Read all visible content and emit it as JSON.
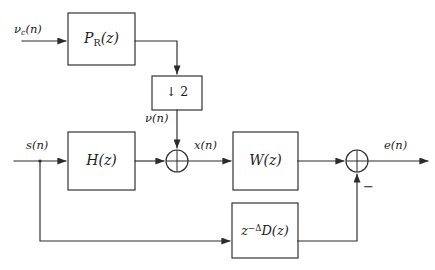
{
  "figure": {
    "type": "signal-flow-block-diagram",
    "background_color": "#ffffff",
    "line_color": "#2b2b2b",
    "width": 435,
    "height": 270
  },
  "blocks": [
    {
      "id": "p_r",
      "label": "P",
      "label_sub": "R",
      "label_tail": "(z)",
      "label_plain": "P_R(z)",
      "x": 68,
      "y": 13,
      "w": 67,
      "h": 52
    },
    {
      "id": "downsampler",
      "label_plain": "↓ 2",
      "x": 152,
      "y": 76,
      "w": 50,
      "h": 34
    },
    {
      "id": "h_z",
      "label_plain": "H(z)",
      "x": 68,
      "y": 132,
      "w": 67,
      "h": 58
    },
    {
      "id": "w_z",
      "label_plain": "W(z)",
      "x": 233,
      "y": 132,
      "w": 65,
      "h": 58
    },
    {
      "id": "d_z",
      "label_plain": "z^{-Δ}D(z)",
      "label_base": "z",
      "label_exp": "−Δ",
      "label_tail": "D(z)",
      "x": 232,
      "y": 203,
      "w": 66,
      "h": 55
    }
  ],
  "sum_nodes": [
    {
      "id": "sum_left",
      "cx": 177,
      "cy": 161,
      "r": 11,
      "style": "cross"
    },
    {
      "id": "sum_right",
      "cx": 357,
      "cy": 161,
      "r": 11,
      "style": "cross"
    }
  ],
  "signal_labels": [
    {
      "id": "nu_c_n",
      "text_base": "ν",
      "text_sub": "c",
      "text_tail": "(n)",
      "plain": "ν_c(n)",
      "x": 14,
      "y": 28
    },
    {
      "id": "nu_n",
      "text_base": "ν",
      "text_tail": "(n)",
      "plain": "ν(n)",
      "x": 146,
      "y": 116
    },
    {
      "id": "s_n",
      "plain": "s(n)",
      "x": 24,
      "y": 139
    },
    {
      "id": "x_n",
      "plain": "x(n)",
      "x": 193,
      "y": 140
    },
    {
      "id": "e_n",
      "plain": "e(n)",
      "x": 383,
      "y": 139
    },
    {
      "id": "minus_sign",
      "plain": "−",
      "x": 364,
      "y": 182
    }
  ],
  "block_text": {
    "p_r_prefix": "P",
    "p_r_sub": "R",
    "p_r_suffix": "(z)",
    "downsampler": "↓ 2",
    "h_z": "H(z)",
    "w_z": "W(z)",
    "d_z_base": "z",
    "d_z_exp": "−Δ",
    "d_z_tail": "D(z)"
  },
  "connections": [
    {
      "from": "input-nu-c",
      "to": "p_r",
      "type": "arrow-right"
    },
    {
      "from": "p_r",
      "to": "downsampler",
      "type": "right-then-down-arrow"
    },
    {
      "from": "downsampler",
      "to": "sum_left",
      "type": "down-arrow"
    },
    {
      "from": "input-s",
      "to": "h_z",
      "type": "arrow-right"
    },
    {
      "from": "input-s-branch",
      "to": "d_z",
      "type": "down-then-right-arrow"
    },
    {
      "from": "h_z",
      "to": "sum_left",
      "type": "arrow-right"
    },
    {
      "from": "sum_left",
      "to": "w_z",
      "type": "arrow-right"
    },
    {
      "from": "w_z",
      "to": "sum_right",
      "type": "arrow-right"
    },
    {
      "from": "d_z",
      "to": "sum_right",
      "type": "right-then-up-arrow",
      "sign": "−"
    },
    {
      "from": "sum_right",
      "to": "output-e",
      "type": "arrow-right"
    }
  ]
}
